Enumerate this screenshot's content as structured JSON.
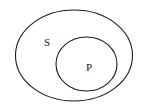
{
  "diagram": {
    "type": "euler-diagram",
    "title": "",
    "background_color": "#ffffff",
    "stroke_color": "#1a1a1a",
    "width": 149,
    "height": 112,
    "sets": [
      {
        "id": "outer-set",
        "label": "S",
        "role": "containing-set",
        "shape": "ellipse",
        "cx": 74,
        "cy": 55.5,
        "rx": 58.5,
        "ry": 45.5,
        "label_x": 47,
        "label_y": 42
      },
      {
        "id": "inner-set",
        "label": "P",
        "role": "contained-subset",
        "shape": "ellipse",
        "cx": 86.5,
        "cy": 64,
        "rx": 30.5,
        "ry": 27,
        "label_x": 89,
        "label_y": 67
      }
    ]
  }
}
